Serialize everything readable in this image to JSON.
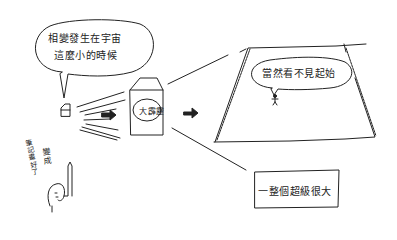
{
  "illustration": {
    "subject": "hand-drawn comic explaining the Big Bang",
    "speech_bubble_top_left": {
      "line1": "相變發生在宇宙",
      "line2": "這麼小的時候"
    },
    "big_bang_label": "大霹靂",
    "observer_speech_bubble": "當然看不見起始",
    "caption_box": "一整個超級很大",
    "side_note_vertical": "筆記畫好了",
    "side_note_short": "變成",
    "arrows": [
      "right-arrow",
      "right-arrow"
    ],
    "colors": {
      "ink": "#222222",
      "background": "#ffffff"
    }
  }
}
